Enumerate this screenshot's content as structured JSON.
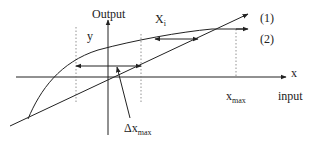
{
  "diagram": {
    "labels": {
      "output": "Output",
      "y": "y",
      "xi_main": "X",
      "xi_sub": "i",
      "curve1": "(1)",
      "curve2": "(2)",
      "x_axis": "x",
      "xmax_main": "x",
      "xmax_sub": "max",
      "input": "input",
      "dxmax_main": "Δx",
      "dxmax_sub": "max"
    },
    "colors": {
      "line": "#222222",
      "dotted": "#777777",
      "background": "#ffffff"
    }
  }
}
